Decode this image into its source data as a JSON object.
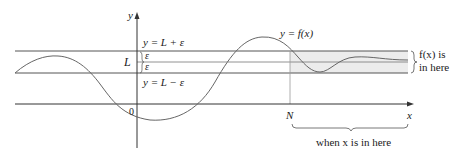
{
  "figure": {
    "axes": {
      "x_label": "x",
      "y_label": "y",
      "origin_label": "0"
    },
    "lines": {
      "upper_label": "y = L + ε",
      "lower_label": "y = L − ε",
      "center_label": "L",
      "epsilon_upper": "ε",
      "epsilon_lower": "ε"
    },
    "curve_label": "y = f(x)",
    "threshold_label": "N",
    "band_annotation_line1": "f(x) is",
    "band_annotation_line2": "in here",
    "domain_annotation": "when x is in here",
    "colors": {
      "axis": "#333333",
      "band_lines": "#555555",
      "curve": "#666666",
      "shade": "#ececec"
    }
  }
}
